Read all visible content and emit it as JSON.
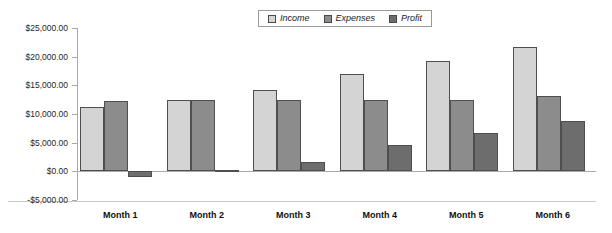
{
  "chart_data": {
    "type": "bar",
    "title": "",
    "subtitle": "",
    "xlabel": "",
    "ylabel": "",
    "categories": [
      "Month 1",
      "Month 2",
      "Month 3",
      "Month 4",
      "Month 5",
      "Month 6"
    ],
    "series": [
      {
        "name": "Income",
        "color": "#d4d4d4",
        "values": [
          11300,
          12500,
          14200,
          17000,
          19200,
          21600
        ]
      },
      {
        "name": "Expenses",
        "color": "#8c8c8c",
        "values": [
          12300,
          12400,
          12400,
          12400,
          12400,
          13100
        ]
      },
      {
        "name": "Profit",
        "color": "#6d6d6d",
        "values": [
          -1000,
          300,
          1700,
          4600,
          6600,
          8700
        ]
      }
    ],
    "ylim": [
      -5000,
      25000
    ],
    "ytick_step": 5000,
    "ytick_labels": [
      "$25,000.00",
      "$20,000.00",
      "$15,000.00",
      "$10,000.00",
      "$5,000.00",
      "$0.00",
      "-$5,000.00"
    ],
    "ytick_values": [
      25000,
      20000,
      15000,
      10000,
      5000,
      0,
      -5000
    ],
    "grid": false,
    "legend_position": "top-center-right",
    "background": "#ffffff",
    "axis_color": "#a9a9a9",
    "bar_border_color": "#4f4f4f"
  },
  "legend": {
    "items": [
      {
        "label": "Income"
      },
      {
        "label": "Expenses"
      },
      {
        "label": "Profit"
      }
    ]
  }
}
